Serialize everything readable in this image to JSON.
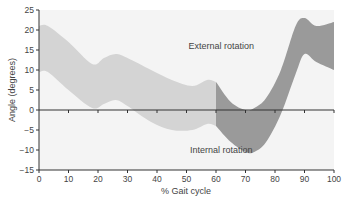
{
  "chart_data": {
    "type": "area",
    "title": "",
    "xlabel": "% Gait cycle",
    "ylabel": "Angle (degrees)",
    "xlim": [
      0,
      100
    ],
    "ylim": [
      -15,
      25
    ],
    "xticks": [
      0,
      10,
      20,
      30,
      40,
      50,
      60,
      70,
      80,
      90,
      100
    ],
    "yticks": [
      25,
      20,
      15,
      10,
      5,
      0,
      -5,
      -10,
      -15
    ],
    "grid": false,
    "annotations": [
      {
        "text": "External rotation",
        "x": 55,
        "y": 16
      },
      {
        "text": "Internal rotation",
        "x": 55,
        "y": -10
      }
    ],
    "series": [
      {
        "name": "stance-phase-band",
        "color": "#d4d4d4",
        "x": [
          0,
          3,
          10,
          18,
          22,
          26,
          30,
          38,
          45,
          52,
          57,
          60
        ],
        "upper": [
          21,
          21,
          17,
          11.5,
          13,
          14,
          13,
          10,
          7.5,
          6,
          7.5,
          7
        ],
        "lower": [
          9.5,
          9.5,
          5,
          0.5,
          1.5,
          2.5,
          1,
          -3,
          -5,
          -5,
          -3.5,
          -4
        ]
      },
      {
        "name": "swing-phase-band",
        "color": "#9a9a9a",
        "x": [
          60,
          65,
          70,
          73,
          77,
          82,
          87,
          90,
          94,
          100
        ],
        "upper": [
          7,
          2,
          0,
          0.5,
          3,
          10,
          21,
          23,
          21,
          22
        ],
        "lower": [
          -4,
          -8,
          -10.5,
          -10.5,
          -8,
          -1,
          9,
          14,
          12,
          10
        ]
      }
    ]
  },
  "colors": {
    "plot_bg": "#f4f4f4",
    "axis": "#333333",
    "light_band": "#d4d4d4",
    "dark_band": "#9a9a9a"
  }
}
